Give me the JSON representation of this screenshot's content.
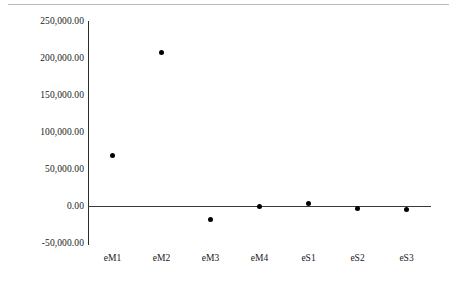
{
  "chart_data": {
    "type": "scatter",
    "title": "",
    "subtitle": "",
    "xlabel": "",
    "ylabel": "",
    "categories": [
      "eM1",
      "eM2",
      "eM3",
      "eM4",
      "eS1",
      "eS2",
      "eS3"
    ],
    "values": [
      70000,
      208000,
      -16000,
      500,
      5000,
      -2000,
      -3500
    ],
    "series": [
      {
        "name": "",
        "values": [
          70000,
          208000,
          -16000,
          500,
          5000,
          -2000,
          -3500
        ]
      }
    ],
    "ylim": [
      -50000,
      250000
    ],
    "ytick_values": [
      250000,
      200000,
      150000,
      100000,
      50000,
      0,
      -50000
    ],
    "ytick_labels": [
      "250,000.00",
      "200,000.00",
      "150,000.00",
      "100,000.00",
      "50,000.00",
      "0.00",
      "-50,000.00"
    ],
    "xtick_labels": [
      "eM1",
      "eM2",
      "eM3",
      "eM4",
      "eS1",
      "eS2",
      "eS3"
    ],
    "grid": false,
    "legend": false,
    "legend_position": "none",
    "marker": "filled-circle",
    "marker_color": "#000000",
    "axis_color": "#2b2b2b",
    "background_color": "#ffffff",
    "zero_line": true,
    "annotations": []
  }
}
